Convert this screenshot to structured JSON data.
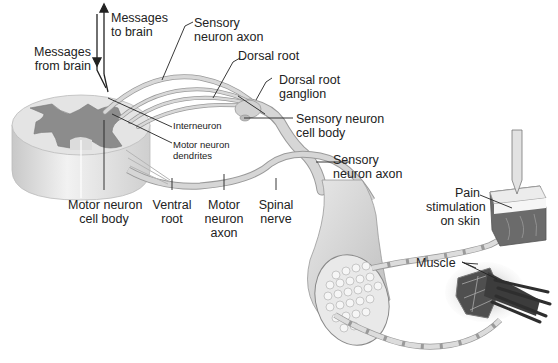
{
  "diagram": {
    "labels": {
      "messages_to_brain": [
        "Messages",
        "to brain"
      ],
      "messages_from_brain": [
        "Messages",
        "from brain"
      ],
      "sensory_neuron_axon_top": [
        "Sensory",
        "neuron axon"
      ],
      "dorsal_root": [
        "Dorsal root"
      ],
      "dorsal_root_ganglion": [
        "Dorsal root",
        "ganglion"
      ],
      "sensory_neuron_cell_body": [
        "Sensory neuron",
        "cell body"
      ],
      "interneuron": [
        "Interneuron"
      ],
      "motor_neuron_dendrites": [
        "Motor neuron",
        "dendrites"
      ],
      "sensory_neuron_axon_mid": [
        "Sensory",
        "neuron axon"
      ],
      "motor_neuron_cell_body": [
        "Motor neuron",
        "cell body"
      ],
      "ventral_root": [
        "Ventral",
        "root"
      ],
      "motor_neuron_axon": [
        "Motor",
        "neuron",
        "axon"
      ],
      "spinal_nerve": [
        "Spinal",
        "nerve"
      ],
      "pain_stimulation": [
        "Pain",
        "stimulation",
        "on skin"
      ],
      "muscle": [
        "Muscle"
      ]
    },
    "colors": {
      "gray_matter": "#8a8a8a",
      "white_matter": "#e6e6e6",
      "nerve": "#d4d4d4",
      "nerve_edge": "#9a9a9a",
      "leader": "#222222",
      "muscle": "#555555"
    }
  }
}
